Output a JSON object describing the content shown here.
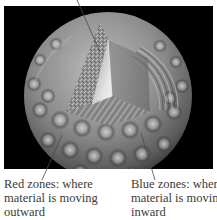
{
  "figure": {
    "background_color": "#000000",
    "page_color": "#ffffff",
    "sphere": {
      "description": "Grayscale sphere with cut-away wedge showing oscillation pattern",
      "pattern": "checkered oscillation zones"
    }
  },
  "callouts": {
    "top": {
      "text": ""
    },
    "left": {
      "lines": [
        "Red zones: where",
        "material is moving",
        "outward"
      ]
    },
    "right": {
      "lines": [
        "Blue zones: where",
        "material is moving",
        "inward"
      ]
    }
  },
  "colors": {
    "label_text": "#3a3a3a",
    "pointer_line": "#555555",
    "sphere_light": "#d8d8d8",
    "sphere_mid": "#8a8a8a",
    "sphere_dark": "#3c3c3c"
  }
}
